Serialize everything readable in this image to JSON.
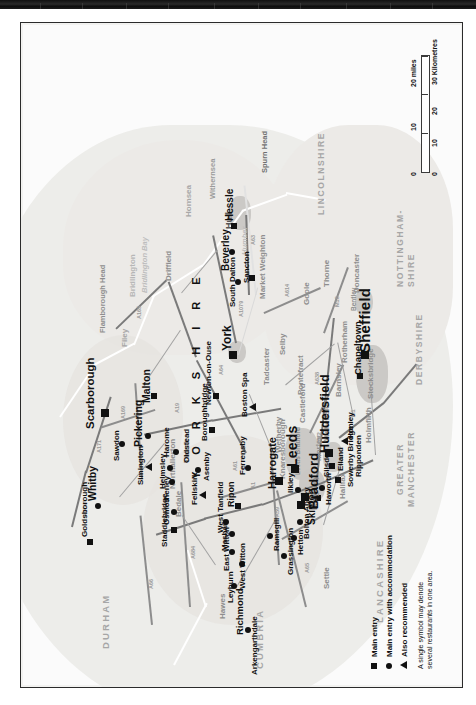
{
  "document": {
    "title": "Yorkshire region restaurant guide map",
    "orientation": "landscape map rotated 90 degrees on a portrait page"
  },
  "legend": {
    "title": "",
    "items": [
      {
        "symbol": "square",
        "label": "Main entry"
      },
      {
        "symbol": "circle",
        "label": "Main entry with accommodation"
      },
      {
        "symbol": "triangle",
        "label": "Also recommended"
      }
    ],
    "note": "A single symbol may denote\nseveral restaurants in one area."
  },
  "scale": {
    "miles_label": "20 miles",
    "miles_ticks": [
      "0",
      "10",
      "20"
    ],
    "km_label": "30 Kilometres",
    "km_ticks": [
      "0",
      "10",
      "20",
      "30"
    ]
  },
  "counties": [
    {
      "name": "DURHAM"
    },
    {
      "name": "CUMBRIA"
    },
    {
      "name": "LANCASHIRE"
    },
    {
      "name": "GREATER\nMANCHESTER"
    },
    {
      "name": "DERBYSHIRE"
    },
    {
      "name": "NOTTINGHAM-\nSHIRE"
    },
    {
      "name": "LINCOLNSHIRE"
    }
  ],
  "region_label": "Y O R K S H I R E",
  "major_places": [
    {
      "name": "Sheffield",
      "symbol": "square"
    },
    {
      "name": "Leeds",
      "symbol": "square"
    },
    {
      "name": "Bradford",
      "symbol": "square"
    },
    {
      "name": "Huddersfield",
      "symbol": "square"
    },
    {
      "name": "Harrogate",
      "symbol": "square"
    },
    {
      "name": "Scarborough",
      "symbol": "square"
    },
    {
      "name": "York",
      "symbol": "square"
    },
    {
      "name": "Beverley",
      "symbol": "circle"
    },
    {
      "name": "Hessle",
      "symbol": "square"
    },
    {
      "name": "Whitby",
      "symbol": "circle"
    },
    {
      "name": "Malton",
      "symbol": "square"
    },
    {
      "name": "Pickering",
      "symbol": "circle"
    },
    {
      "name": "Skipton",
      "symbol": "square"
    }
  ],
  "places": [
    "Goldsborough",
    "Whitby",
    "Scarborough",
    "Sawdon",
    "Pickering",
    "Malton",
    "Simington",
    "Harome",
    "Helmsley",
    "Oldstead",
    "Staddlebridge",
    "Osmotherley",
    "Feliskirk",
    "Asenby",
    "Boroughbridge",
    "Newton-on-Ouse",
    "York",
    "Boston Spa",
    "Ferrensby",
    "Harrogate",
    "Ripon",
    "West Tanfield",
    "Masham",
    "East Witton",
    "West Witton",
    "Leyburn",
    "Richmond",
    "Arkengarthdale",
    "Ramsgill",
    "Grassington",
    "Hetton",
    "Bolton Abbey",
    "Skipton",
    "Haworth",
    "Keighley",
    "Ilkley",
    "Silsden",
    "Bradford",
    "Leeds",
    "Elland",
    "Sowerby Bridge",
    "Ripponden",
    "Huddersfield",
    "Honley",
    "Chapeltown",
    "Sheffield",
    "South Dalton",
    "Sancton",
    "Beverley",
    "Hessle"
  ],
  "grey_places": [
    "Northallerton",
    "Thirsk",
    "Bedale",
    "Settle",
    "Hawes",
    "Halifax",
    "Morley",
    "Wakefield",
    "Castleford",
    "Pontefract",
    "Selby",
    "Tadcaster",
    "Knaresborough",
    "Wetherby",
    "Leeds Bradford",
    "Barnsley",
    "Rotherham",
    "Stocksbridge",
    "Holmfirth",
    "Market Weighton",
    "Goole",
    "Thorne",
    "Doncaster",
    "Bentley",
    "Driffield",
    "Bridlington",
    "Filey",
    "Hornsea",
    "Hull"
  ],
  "water_features": [
    "Bridlington Bay",
    "Flamborough Head",
    "Spurn Head",
    "Humber",
    "Withernsea"
  ],
  "road_numbers": [
    "A174",
    "A171",
    "A169",
    "A165",
    "A64",
    "A19",
    "A1",
    "M1",
    "M62",
    "A66",
    "A684",
    "A59",
    "A65",
    "A61",
    "A638",
    "A614",
    "A63",
    "M18",
    "A1079"
  ],
  "colors": {
    "land": "#ededea",
    "sea": "#fbfbfb",
    "urban": "#c9c7c4",
    "road": "#8d8d8d",
    "symbol": "#111111",
    "county_text": "#a6a6a6",
    "water_text": "#bdbdbd"
  }
}
